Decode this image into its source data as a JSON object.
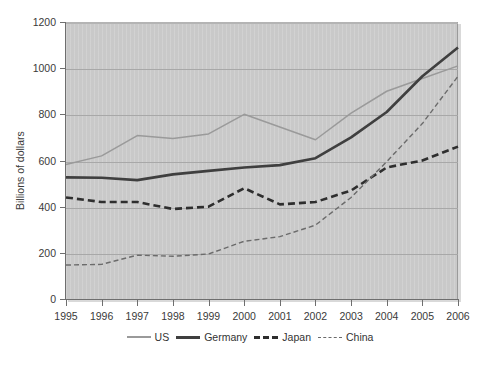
{
  "chart_data": {
    "type": "line",
    "title": "",
    "subtitle": "",
    "xlabel": "",
    "ylabel": "Billions of dollars",
    "x": [
      1995,
      1996,
      1997,
      1998,
      1999,
      2000,
      2001,
      2002,
      2003,
      2004,
      2005,
      2006
    ],
    "categories": [
      "1995",
      "1996",
      "1997",
      "1998",
      "1999",
      "2000",
      "2001",
      "2002",
      "2003",
      "2004",
      "2005",
      "2006"
    ],
    "xlim": [
      1995,
      2006
    ],
    "ylim": [
      0,
      1200
    ],
    "yticks": [
      0,
      200,
      400,
      600,
      800,
      1000,
      1200
    ],
    "ytick_labels": [
      "0",
      "200",
      "400",
      "600",
      "800",
      "1000",
      "1200"
    ],
    "grid": true,
    "grid_axis": "y",
    "legend_position": "bottom",
    "plot_background": "#c9c9c9",
    "figure_background": "#ffffff",
    "series": [
      {
        "name": "US",
        "color": "#9a9a9a",
        "width": 1.5,
        "dash": "none",
        "values": [
          583,
          620,
          708,
          695,
          715,
          800,
          745,
          690,
          805,
          900,
          955,
          1010
        ]
      },
      {
        "name": "Germany",
        "color": "#3f3f3f",
        "width": 2.6,
        "dash": "none",
        "values": [
          527,
          525,
          515,
          540,
          555,
          570,
          580,
          610,
          700,
          810,
          965,
          1090
        ]
      },
      {
        "name": "Japan",
        "color": "#2e2e2e",
        "width": 2.6,
        "dash": "7,4",
        "values": [
          440,
          420,
          420,
          390,
          400,
          480,
          410,
          420,
          470,
          570,
          600,
          660
        ]
      },
      {
        "name": "China",
        "color": "#6b6b6b",
        "width": 1.4,
        "dash": "5,3",
        "values": [
          147,
          150,
          190,
          185,
          195,
          250,
          270,
          320,
          440,
          595,
          760,
          965
        ]
      }
    ]
  },
  "legend": {
    "entries": [
      {
        "label": "US"
      },
      {
        "label": "Germany"
      },
      {
        "label": "Japan"
      },
      {
        "label": "China"
      }
    ]
  }
}
